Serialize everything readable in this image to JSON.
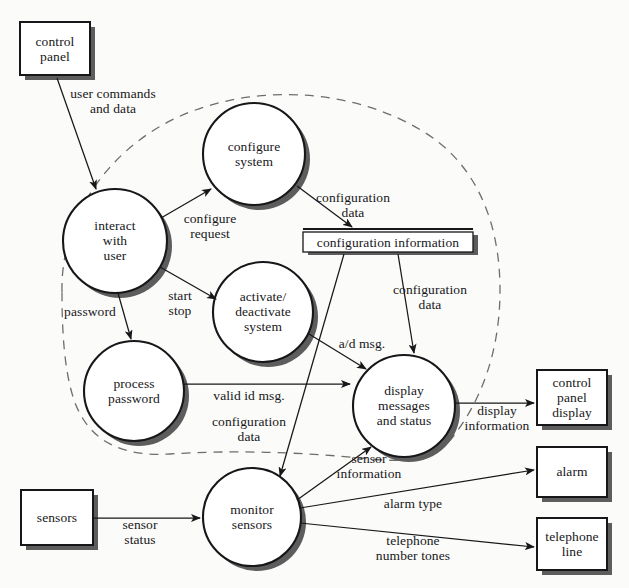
{
  "diagram": {
    "type": "data-flow-diagram",
    "boundary": {
      "style": "dashed",
      "label": "system boundary"
    },
    "colors": {
      "background": "#fbfbf9",
      "stroke": "#17171a",
      "shadow": "#595959",
      "fill": "#ffffff",
      "boundary": "#6d6d6d"
    }
  },
  "external_entities": [
    {
      "id": "control-panel",
      "label": "control\npanel",
      "x": 20,
      "y": 22,
      "w": 70,
      "h": 53
    },
    {
      "id": "sensors",
      "label": "sensors",
      "x": 21,
      "y": 490,
      "w": 72,
      "h": 55
    },
    {
      "id": "control-panel-display",
      "label": "control\npanel\ndisplay",
      "x": 537,
      "y": 370,
      "w": 70,
      "h": 55
    },
    {
      "id": "alarm",
      "label": "alarm",
      "x": 537,
      "y": 447,
      "w": 70,
      "h": 50
    },
    {
      "id": "telephone-line",
      "label": "telephone\nline",
      "x": 537,
      "y": 518,
      "w": 70,
      "h": 52
    }
  ],
  "processes": [
    {
      "id": "configure-system",
      "label": "configure\nsystem",
      "cx": 254,
      "cy": 154,
      "r": 51
    },
    {
      "id": "interact-with-user",
      "label": "interact\nwith\nuser",
      "cx": 115,
      "cy": 241,
      "r": 52
    },
    {
      "id": "activate-deactivate",
      "label": "activate/\ndeactivate\nsystem",
      "cx": 263,
      "cy": 312,
      "r": 50
    },
    {
      "id": "process-password",
      "label": "process\npassword",
      "cx": 134,
      "cy": 391,
      "r": 50
    },
    {
      "id": "display-messages",
      "label": "display\nmessages\nand status",
      "cx": 404,
      "cy": 406,
      "r": 51
    },
    {
      "id": "monitor-sensors",
      "label": "monitor\nsensors",
      "cx": 252,
      "cy": 517,
      "r": 49
    }
  ],
  "data_stores": [
    {
      "id": "configuration-information",
      "label": "configuration information",
      "x": 303,
      "y": 230,
      "w": 170,
      "h": 20
    }
  ],
  "flows": [
    {
      "id": "user-commands-and-data",
      "label": "user commands\nand data",
      "from": "control-panel",
      "to": "interact-with-user",
      "lx": 113,
      "ly": 101
    },
    {
      "id": "configure-request",
      "label": "configure\nrequest",
      "from": "interact-with-user",
      "to": "configure-system",
      "lx": 210,
      "ly": 226
    },
    {
      "id": "configuration-data-1",
      "label": "configuration\ndata",
      "from": "configure-system",
      "to": "configuration-information",
      "lx": 353,
      "ly": 205
    },
    {
      "id": "start-stop",
      "label": "start\nstop",
      "from": "interact-with-user",
      "to": "activate-deactivate",
      "lx": 180,
      "ly": 303
    },
    {
      "id": "password",
      "label": "password",
      "from": "interact-with-user",
      "to": "process-password",
      "lx": 90,
      "ly": 312
    },
    {
      "id": "configuration-data-2",
      "label": "configuration\ndata",
      "from": "configuration-information",
      "to": "display-messages",
      "lx": 430,
      "ly": 297
    },
    {
      "id": "a-d-msg",
      "label": "a/d msg.",
      "from": "activate-deactivate",
      "to": "display-messages",
      "lx": 362,
      "ly": 344
    },
    {
      "id": "valid-id-msg",
      "label": "valid id msg.",
      "from": "process-password",
      "to": "display-messages",
      "lx": 249,
      "ly": 396
    },
    {
      "id": "configuration-data-3",
      "label": "configuration\ndata",
      "from": "configuration-information",
      "to": "monitor-sensors",
      "lx": 249,
      "ly": 429
    },
    {
      "id": "sensor-information",
      "label": "sensor\ninformation",
      "from": "monitor-sensors",
      "to": "display-messages",
      "lx": 369,
      "ly": 466
    },
    {
      "id": "display-information",
      "label": "display\ninformation",
      "from": "display-messages",
      "to": "control-panel-display",
      "lx": 497,
      "ly": 418
    },
    {
      "id": "sensor-status",
      "label": "sensor\nstatus",
      "from": "sensors",
      "to": "monitor-sensors",
      "lx": 140,
      "ly": 532
    },
    {
      "id": "alarm-type",
      "label": "alarm type",
      "from": "monitor-sensors",
      "to": "alarm",
      "lx": 413,
      "ly": 504
    },
    {
      "id": "telephone-number-tones",
      "label": "telephone\nnumber tones",
      "from": "monitor-sensors",
      "to": "telephone-line",
      "lx": 413,
      "ly": 548
    }
  ]
}
